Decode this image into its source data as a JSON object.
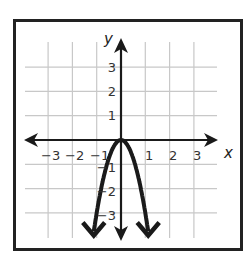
{
  "chart_data": {
    "type": "line",
    "title": "",
    "xlabel": "x",
    "ylabel": "y",
    "xlim": [
      -4,
      4
    ],
    "ylim": [
      -4,
      4
    ],
    "grid": true,
    "x_ticks": [
      "-3",
      "-2",
      "-1",
      "1",
      "2",
      "3"
    ],
    "y_ticks": [
      "3",
      "2",
      "1",
      "-1",
      "-2",
      "-3"
    ],
    "series": [
      {
        "name": "parabola",
        "equation": "y = -3x^2",
        "x": [
          -1.15,
          -1,
          -0.75,
          -0.5,
          -0.25,
          0,
          0.25,
          0.5,
          0.75,
          1,
          1.15
        ],
        "y": [
          -3.9,
          -3,
          -1.69,
          -0.75,
          -0.19,
          0,
          -0.19,
          -0.75,
          -1.69,
          -3,
          -3.9
        ],
        "arrows": "both ends downward"
      }
    ],
    "colors": {
      "curve": "#1a1a1a",
      "grid": "#c8c8c8",
      "axis": "#1a1a1a",
      "frame": "#222222"
    }
  },
  "labels": {
    "x_axis": "x",
    "y_axis": "y",
    "x_ticks": [
      {
        "text": "−3",
        "x": 41
      },
      {
        "text": "−2",
        "x": 65
      },
      {
        "text": "−1",
        "x": 90
      },
      {
        "text": "1",
        "x": 145
      },
      {
        "text": "2",
        "x": 169
      },
      {
        "text": "3",
        "x": 193
      }
    ],
    "y_ticks": [
      {
        "text": "3",
        "y": 72
      },
      {
        "text": "2",
        "y": 96
      },
      {
        "text": "1",
        "y": 120
      },
      {
        "text": "−1",
        "y": 172
      },
      {
        "text": "−2",
        "y": 196
      },
      {
        "text": "−3",
        "y": 220
      }
    ]
  }
}
